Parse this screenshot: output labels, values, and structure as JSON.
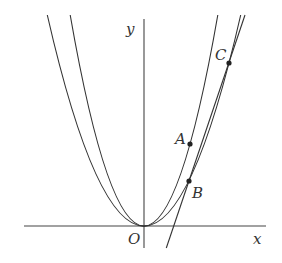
{
  "diagram": {
    "type": "coordinate-plane",
    "axes": {
      "x_label": "x",
      "y_label": "y",
      "origin_label": "O"
    },
    "curves": [
      {
        "name": "narrow-parabola",
        "description": "parabola through O and A"
      },
      {
        "name": "wide-parabola",
        "description": "parabola through O, B and C"
      },
      {
        "name": "line",
        "description": "line through B and C"
      }
    ],
    "points": [
      {
        "label": "A",
        "on": "narrow-parabola"
      },
      {
        "label": "B",
        "on": "wide-parabola and line"
      },
      {
        "label": "C",
        "on": "wide-parabola and line"
      }
    ]
  }
}
